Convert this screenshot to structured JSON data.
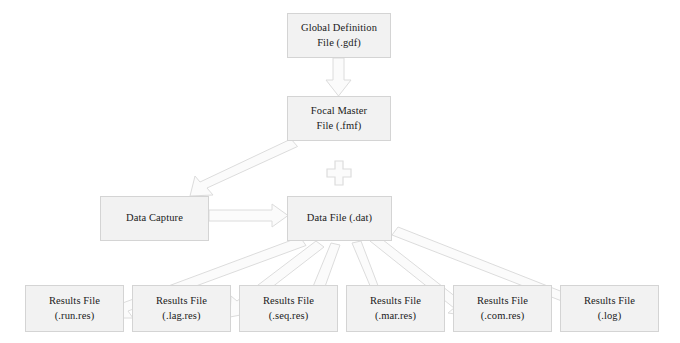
{
  "diagram": {
    "type": "flowchart",
    "title": "",
    "background_color": "#ffffff",
    "node_fill_color": "#f2f2f2",
    "node_border_color": "#d4d4d4",
    "arrow_fill_color": "#fbfbfb",
    "arrow_border_color": "#dcdcdc",
    "text_color": "#1a1a1a",
    "nodes": {
      "global_definition": {
        "line1": "Global Definition",
        "line2": "File (.gdf)"
      },
      "focal_master": {
        "line1": "Focal Master",
        "line2": "File (.fmf)"
      },
      "data_capture": {
        "line1": "Data Capture",
        "line2": ""
      },
      "data_file": {
        "line1": "Data File (.dat)",
        "line2": ""
      },
      "results": [
        {
          "line1": "Results File",
          "line2": "(.run.res)"
        },
        {
          "line1": "Results File",
          "line2": "(.lag.res)"
        },
        {
          "line1": "Results File",
          "line2": "(.seq.res)"
        },
        {
          "line1": "Results File",
          "line2": "(.mar.res)"
        },
        {
          "line1": "Results File",
          "line2": "(.com.res)"
        },
        {
          "line1": "Results File",
          "line2": "(.log)"
        }
      ]
    },
    "connectors": {
      "gdf_to_fmf": "arrow-down",
      "fmf_to_capture_area": "arrow-down-left",
      "capture_to_datafile": "arrow-right",
      "combine_symbol": "plus-icon",
      "datafile_to_results": "arrow-fan-down"
    }
  }
}
